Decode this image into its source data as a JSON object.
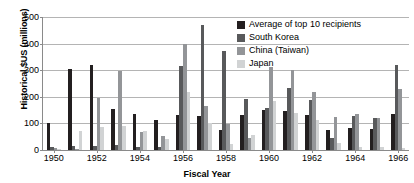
{
  "chart_data": {
    "type": "bar",
    "title": "",
    "subtitle": "",
    "xlabel": "Fiscal Year",
    "ylabel": "Historical $US (millions)",
    "ylim": [
      0,
      500
    ],
    "ytick_values": [
      0,
      100,
      200,
      300,
      400,
      500
    ],
    "ytick_labels": [
      "0",
      "100",
      "200",
      "300",
      "400",
      "500"
    ],
    "grid": true,
    "legend_position": "top-right-inside",
    "categories": [
      "1950",
      "1951",
      "1952",
      "1953",
      "1954",
      "1955",
      "1956",
      "1957",
      "1958",
      "1959",
      "1960",
      "1961",
      "1962",
      "1963",
      "1964",
      "1965",
      "1966"
    ],
    "xtick_labels": [
      "1950",
      "1952",
      "1954",
      "1956",
      "1958",
      "1960",
      "1962",
      "1964",
      "1966"
    ],
    "series": [
      {
        "name": "Average of top 10 recipients",
        "color": "#231f20",
        "values": [
          103,
          303,
          318,
          155,
          135,
          112,
          131,
          127,
          76,
          133,
          151,
          148,
          130,
          74,
          82,
          78,
          137
        ]
      },
      {
        "name": "South Korea",
        "color": "#58595b",
        "values": [
          10,
          15,
          15,
          18,
          12,
          10,
          314,
          469,
          373,
          193,
          159,
          232,
          188,
          44,
          129,
          120,
          321
        ]
      },
      {
        "name": "China (Taiwan)",
        "color": "#939598",
        "values": [
          7,
          5,
          196,
          296,
          67,
          51,
          398,
          165,
          98,
          44,
          313,
          302,
          219,
          123,
          137,
          122,
          231
        ]
      },
      {
        "name": "Japan",
        "color": "#d1d3d4",
        "values": [
          5,
          72,
          88,
          90,
          72,
          43,
          219,
          102,
          22,
          56,
          186,
          138,
          111,
          25,
          12,
          10,
          8
        ]
      }
    ]
  },
  "legend": {
    "items": [
      {
        "label": "Average of top 10 recipients",
        "color": "#231f20"
      },
      {
        "label": "South Korea",
        "color": "#58595b"
      },
      {
        "label": "China (Taiwan)",
        "color": "#939598"
      },
      {
        "label": "Japan",
        "color": "#d1d3d4"
      }
    ]
  }
}
